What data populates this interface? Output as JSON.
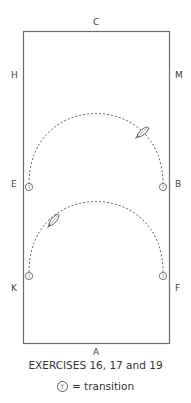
{
  "arena": {
    "letters": {
      "top": "C",
      "bottom": "A",
      "left_upper": "H",
      "left_middle": "E",
      "left_lower": "K",
      "right_upper": "M",
      "right_middle": "B",
      "right_lower": "F"
    },
    "border_color": "#6b6b6b",
    "path_color": "#555555"
  },
  "figures": [
    {
      "name": "upper-half-circle",
      "from": "E",
      "to": "B",
      "direction": "clockwise-toward-B",
      "transition_markers": [
        "E",
        "B"
      ]
    },
    {
      "name": "lower-half-circle",
      "from": "F",
      "to": "K",
      "direction": "toward-K",
      "transition_markers": [
        "K",
        "F"
      ]
    }
  ],
  "transition_symbol": "T",
  "caption": "EXERCISES 16, 17 and 19",
  "legend": {
    "symbol": "T",
    "text": "= transition"
  }
}
